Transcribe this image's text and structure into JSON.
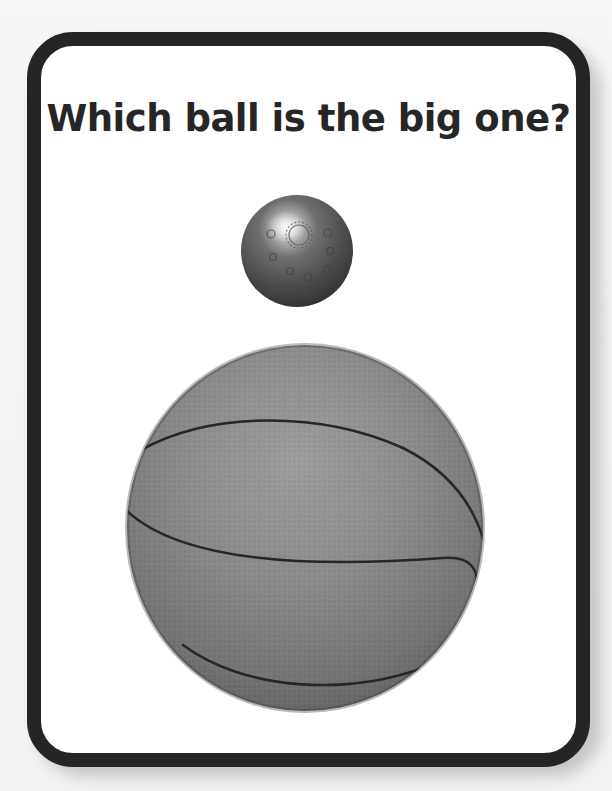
{
  "card": {
    "question": "Which ball is the big one?",
    "border_color": "#252525",
    "background_color": "#ffffff"
  },
  "images": [
    {
      "id": "small-ball",
      "description": "small metal ball (bocce/jack ball) with engraved sun pattern",
      "size": "small",
      "tone": "dark gray metallic"
    },
    {
      "id": "big-ball",
      "description": "basketball",
      "size": "big",
      "tone": "medium gray with dark seams"
    }
  ]
}
